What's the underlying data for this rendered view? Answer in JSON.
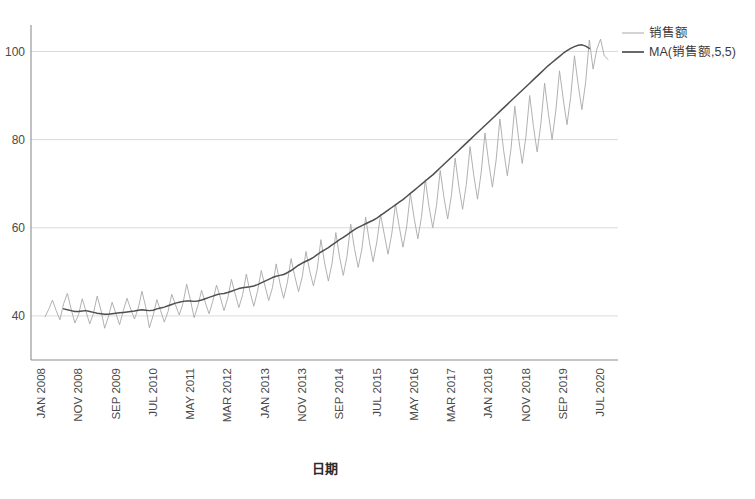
{
  "chart_data": {
    "type": "line",
    "title": "",
    "xlabel": "日期",
    "ylabel": "",
    "ylim": [
      30,
      106
    ],
    "yticks": [
      40,
      60,
      80,
      100
    ],
    "ytick_labels": [
      "40",
      "60",
      "80",
      "100"
    ],
    "grid": "horizontal",
    "legend_position": "top-right",
    "xtick_labels": [
      "JAN 2008",
      "NOV 2008",
      "SEP 2009",
      "JUL 2010",
      "MAY 2011",
      "MAR 2012",
      "JAN 2013",
      "NOV 2013",
      "SEP 2014",
      "JUL 2015",
      "MAY 2016",
      "MAR 2017",
      "JAN 2018",
      "NOV 2018",
      "SEP 2019",
      "JUL 2020"
    ],
    "xtick_indices": [
      0,
      10,
      20,
      30,
      40,
      50,
      60,
      70,
      80,
      90,
      100,
      110,
      120,
      130,
      140,
      150
    ],
    "x_start": "JAN 2008",
    "x_end": "OCT 2020",
    "series": [
      {
        "name": "销售额",
        "color": "#a8a8a8",
        "width": 0.9,
        "values": [
          39.8,
          41.5,
          43.6,
          41.2,
          39.1,
          42.8,
          45.1,
          41.6,
          38.4,
          40.3,
          43.9,
          41.0,
          38.2,
          40.6,
          44.5,
          41.3,
          37.2,
          39.8,
          43.1,
          40.6,
          38.0,
          41.2,
          44.0,
          41.5,
          39.3,
          41.7,
          45.6,
          42.1,
          37.3,
          40.1,
          43.7,
          41.2,
          38.6,
          41.0,
          44.9,
          42.5,
          40.2,
          42.8,
          47.2,
          43.6,
          39.6,
          42.3,
          45.8,
          43.0,
          40.5,
          43.3,
          47.0,
          44.3,
          41.2,
          44.0,
          48.3,
          45.0,
          41.9,
          44.8,
          49.5,
          45.4,
          42.2,
          45.6,
          50.3,
          46.8,
          43.5,
          46.4,
          51.8,
          47.5,
          44.0,
          47.6,
          53.0,
          49.0,
          45.5,
          48.9,
          54.6,
          50.2,
          46.8,
          50.6,
          57.3,
          52.0,
          47.9,
          52.0,
          58.9,
          53.4,
          49.2,
          53.5,
          60.8,
          55.3,
          51.0,
          55.2,
          62.4,
          56.8,
          52.3,
          56.8,
          63.0,
          58.5,
          54.0,
          58.6,
          65.4,
          60.3,
          55.6,
          60.2,
          67.8,
          62.2,
          57.5,
          62.6,
          70.9,
          64.8,
          60.0,
          65.0,
          73.0,
          66.9,
          62.0,
          67.3,
          75.8,
          69.4,
          64.2,
          69.8,
          78.4,
          71.9,
          66.5,
          72.6,
          81.5,
          74.8,
          69.2,
          75.4,
          84.7,
          77.6,
          71.8,
          78.0,
          87.6,
          80.4,
          74.6,
          80.8,
          90.0,
          83.0,
          77.2,
          83.6,
          92.8,
          86.0,
          80.0,
          86.5,
          95.6,
          89.2,
          83.4,
          89.8,
          99.0,
          92.5,
          86.8,
          93.0,
          102.6,
          96.0,
          100.5,
          102.8,
          99.0,
          98.2
        ]
      },
      {
        "name": "MA(销售额,5,5)",
        "color": "#4f4f4f",
        "width": 1.5,
        "values": [
          null,
          null,
          null,
          null,
          null,
          41.6,
          41.4,
          41.2,
          41.0,
          41.0,
          41.1,
          41.2,
          41.0,
          40.8,
          40.6,
          40.5,
          40.4,
          40.4,
          40.5,
          40.6,
          40.7,
          40.8,
          40.9,
          41.0,
          41.1,
          41.3,
          41.4,
          41.3,
          41.2,
          41.3,
          41.6,
          41.8,
          42.0,
          42.3,
          42.6,
          42.9,
          43.1,
          43.3,
          43.4,
          43.4,
          43.3,
          43.4,
          43.6,
          43.9,
          44.2,
          44.5,
          44.8,
          45.0,
          45.1,
          45.3,
          45.6,
          45.9,
          46.2,
          46.4,
          46.5,
          46.6,
          46.8,
          47.1,
          47.5,
          47.9,
          48.3,
          48.7,
          49.0,
          49.2,
          49.4,
          49.8,
          50.3,
          50.9,
          51.5,
          52.0,
          52.4,
          52.8,
          53.3,
          53.9,
          54.5,
          55.0,
          55.5,
          56.1,
          56.7,
          57.3,
          57.8,
          58.4,
          59.0,
          59.6,
          60.1,
          60.5,
          60.9,
          61.3,
          61.7,
          62.2,
          62.8,
          63.4,
          64.0,
          64.6,
          65.2,
          65.8,
          66.4,
          67.1,
          67.8,
          68.5,
          69.2,
          69.9,
          70.6,
          71.3,
          72.0,
          72.8,
          73.6,
          74.4,
          75.2,
          76.0,
          76.8,
          77.6,
          78.4,
          79.2,
          80.0,
          80.8,
          81.6,
          82.4,
          83.2,
          84.0,
          84.8,
          85.6,
          86.4,
          87.2,
          88.0,
          88.8,
          89.6,
          90.4,
          91.2,
          92.0,
          92.8,
          93.6,
          94.4,
          95.2,
          96.0,
          96.8,
          97.5,
          98.2,
          98.9,
          99.6,
          100.2,
          100.7,
          101.1,
          101.4,
          101.5,
          101.2,
          100.7,
          null,
          null,
          null,
          null,
          null
        ]
      }
    ]
  },
  "legend": {
    "items": [
      {
        "label": "销售额",
        "color": "#a8a8a8"
      },
      {
        "label": "MA(销售额,5,5)",
        "color": "#4f4f4f"
      }
    ]
  },
  "axes": {
    "x_title": "日期",
    "y_tick_labels": [
      "100",
      "80",
      "60",
      "40"
    ]
  }
}
